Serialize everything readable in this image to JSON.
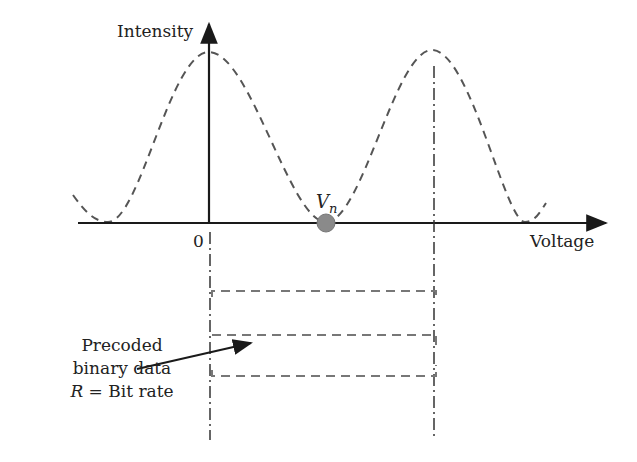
{
  "diagram": {
    "y_axis_label": "Intensity",
    "x_axis_label": "Voltage",
    "origin_label": "0",
    "bias_point_label": "V",
    "bias_point_subscript": "n",
    "annotation": {
      "line1": "Precoded",
      "line2": "binary data",
      "line3_var": "R",
      "line3_rest": " = Bit rate"
    },
    "colors": {
      "axis": "#1a1a1a",
      "curve": "#555555",
      "bias_dot": "#8a8a8a",
      "data_lines": "#777777"
    }
  }
}
